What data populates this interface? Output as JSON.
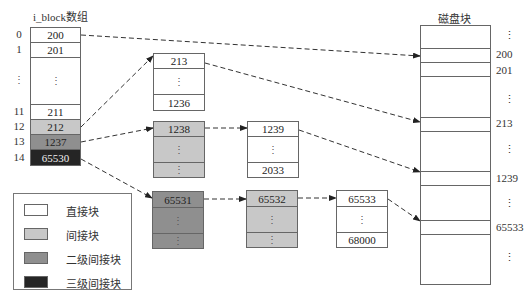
{
  "iblock": {
    "title": "i_block数组",
    "rows": [
      {
        "index": "0",
        "value": "200",
        "type": "direct"
      },
      {
        "index": "1",
        "value": "201",
        "type": "direct"
      },
      {
        "index": "⋮",
        "value": "⋮",
        "type": "direct"
      },
      {
        "index": "11",
        "value": "211",
        "type": "direct"
      },
      {
        "index": "12",
        "value": "212",
        "type": "indirect"
      },
      {
        "index": "13",
        "value": "1237",
        "type": "double-indirect"
      },
      {
        "index": "14",
        "value": "65530",
        "type": "triple-indirect"
      }
    ]
  },
  "blocks": {
    "b212": {
      "top": "213",
      "middle": "⋮",
      "bottom": "1236"
    },
    "b1237": {
      "top": "1238",
      "middle": "⋮",
      "bottom": "⋮"
    },
    "b1238": {
      "top": "1239",
      "middle": "⋮",
      "bottom": "2033"
    },
    "b65530": {
      "top": "65531",
      "middle": "⋮",
      "bottom": "⋮"
    },
    "b65531": {
      "top": "65532",
      "middle": "⋮",
      "bottom": "⋮"
    },
    "b65532": {
      "top": "65533",
      "middle": "⋮",
      "bottom": "68000"
    }
  },
  "disk": {
    "title": "磁盘块",
    "labels": [
      "⋮",
      "200",
      "201",
      "⋮",
      "213",
      "⋮",
      "1239",
      "⋮",
      "65533",
      "⋮"
    ]
  },
  "legend": {
    "items": [
      {
        "label": "直接块",
        "color": "#ffffff"
      },
      {
        "label": "间接块",
        "color": "#c8c8c8"
      },
      {
        "label": "二级间接块",
        "color": "#8f8f8f"
      },
      {
        "label": "三级间接块",
        "color": "#252525"
      }
    ]
  }
}
